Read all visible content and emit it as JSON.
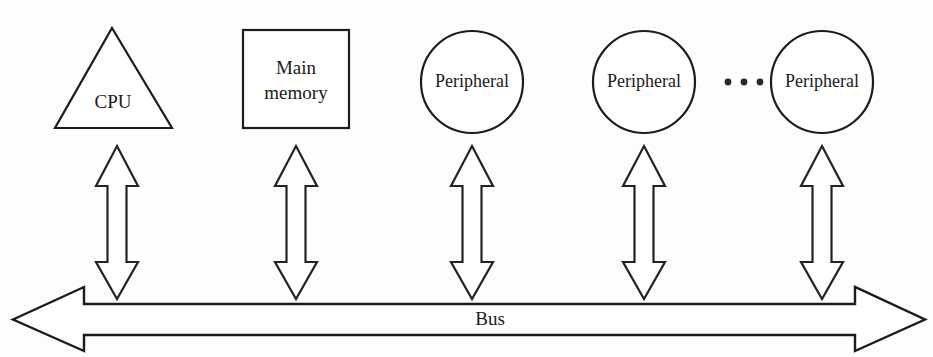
{
  "diagram": {
    "type": "single-bus computer architecture",
    "nodes": [
      {
        "id": "cpu",
        "shape": "triangle",
        "label": "CPU",
        "lines": [
          "CPU"
        ],
        "cx": 114
      },
      {
        "id": "main-memory",
        "shape": "square",
        "label": "Main memory",
        "lines": [
          "Main",
          "memory"
        ],
        "cx": 296
      },
      {
        "id": "peripheral-1",
        "shape": "circle",
        "label": "Peripheral",
        "lines": [
          "Peripheral"
        ],
        "cx": 472
      },
      {
        "id": "peripheral-2",
        "shape": "circle",
        "label": "Peripheral",
        "lines": [
          "Peripheral"
        ],
        "cx": 644
      },
      {
        "id": "peripheral-3",
        "shape": "circle",
        "label": "Peripheral",
        "lines": [
          "Peripheral"
        ],
        "cx": 822
      }
    ],
    "ellipsis": {
      "text": "...",
      "dots": 3,
      "cx": 744,
      "cy": 82
    },
    "connectors": [
      {
        "id": "connector-cpu",
        "from": "cpu",
        "to": "bus",
        "style": "double-headed-arrow",
        "orientation": "vertical",
        "cx": 117
      },
      {
        "id": "connector-main-memory",
        "from": "main-memory",
        "to": "bus",
        "style": "double-headed-arrow",
        "orientation": "vertical",
        "cx": 296
      },
      {
        "id": "connector-peripheral-1",
        "from": "peripheral-1",
        "to": "bus",
        "style": "double-headed-arrow",
        "orientation": "vertical",
        "cx": 472
      },
      {
        "id": "connector-peripheral-2",
        "from": "peripheral-2",
        "to": "bus",
        "style": "double-headed-arrow",
        "orientation": "vertical",
        "cx": 644
      },
      {
        "id": "connector-peripheral-3",
        "from": "peripheral-3",
        "to": "bus",
        "style": "double-headed-arrow",
        "orientation": "vertical",
        "cx": 822
      }
    ],
    "bus": {
      "id": "bus",
      "label": "Bus",
      "style": "double-headed-arrow",
      "orientation": "horizontal",
      "label_cx": 490,
      "label_cy": 320
    },
    "colors": {
      "stroke": "#1c1c1c",
      "fill": "#ffffff",
      "background": "#fdfdfd",
      "text": "#1a1a1a"
    }
  }
}
